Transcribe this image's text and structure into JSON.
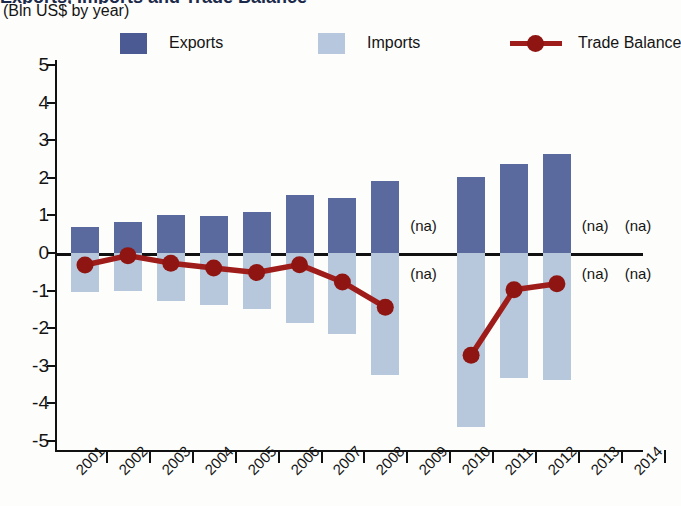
{
  "header": {
    "title_fragment": "Exports, Imports and Trade Balance",
    "subtitle": "(Bln US$ by year)"
  },
  "legend": [
    {
      "name": "exports",
      "label": "Exports",
      "color": "#5a6a9e",
      "marker": "square"
    },
    {
      "name": "imports",
      "label": "Imports",
      "color": "#b8c8dc",
      "marker": "square"
    },
    {
      "name": "trade-balance",
      "label": "Trade Balance",
      "color": "#9e1c19",
      "marker": "line-circle"
    }
  ],
  "chart_data": {
    "type": "bar",
    "title": "Exports, Imports and Trade Balance",
    "subtitle": "(Bln US$ by year)",
    "xlabel": "",
    "ylabel": "",
    "ylim": [
      -5,
      5
    ],
    "yticks": [
      5,
      4,
      3,
      2,
      1,
      0,
      -1,
      -2,
      -3,
      -4,
      -5
    ],
    "ytick_labels": [
      "5",
      "4",
      "3",
      "2",
      "1",
      "0",
      "-1",
      "-2",
      "-3",
      "-4",
      "-5"
    ],
    "grid": false,
    "legend_position": "top",
    "categories": [
      "2001",
      "2002",
      "2003",
      "2004",
      "2005",
      "2006",
      "2007",
      "2008",
      "2009",
      "2010",
      "2011",
      "2012",
      "2013",
      "2014"
    ],
    "na_label": "(na)",
    "na_years": [
      "2009",
      "2013",
      "2014"
    ],
    "series": [
      {
        "name": "Exports",
        "type": "bar",
        "color": "#5a6a9e",
        "values": [
          0.7,
          0.82,
          1.01,
          0.98,
          1.09,
          1.54,
          1.45,
          1.92,
          null,
          2.01,
          2.38,
          2.62,
          null,
          null
        ]
      },
      {
        "name": "Imports",
        "type": "bar",
        "color": "#b8c8dc",
        "values": [
          -1.04,
          -1.0,
          -1.28,
          -1.38,
          -1.49,
          -1.87,
          -2.15,
          -3.25,
          null,
          -4.63,
          -3.33,
          -3.39,
          null,
          null
        ]
      },
      {
        "name": "Trade Balance",
        "type": "line",
        "color": "#9e1c19",
        "values": [
          -0.32,
          -0.07,
          -0.27,
          -0.4,
          -0.52,
          -0.31,
          -0.77,
          -1.44,
          null,
          -2.72,
          -0.98,
          -0.82,
          null,
          null
        ]
      }
    ]
  }
}
